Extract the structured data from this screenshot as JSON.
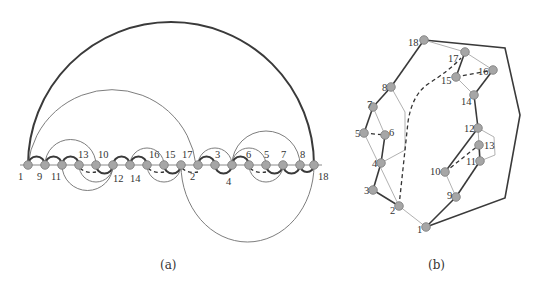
{
  "colors": {
    "node_fill": "#a6a6a6",
    "node_stroke": "#7a7a7a",
    "thick_edge": "#3a3a3a",
    "thin_edge": "#6e6e6e",
    "light_edge": "#a8a8a8",
    "dashed_edge": "#333333",
    "label": "#333333"
  },
  "panel_a": {
    "caption": "(a)",
    "spine_order": [
      "1",
      "9",
      "11",
      "13",
      "10",
      "12",
      "14",
      "16",
      "15",
      "17",
      "2",
      "3",
      "4",
      "6",
      "5",
      "7",
      "8",
      "18"
    ],
    "spine_x": [
      28,
      45,
      62,
      79,
      96,
      113,
      130,
      147,
      164,
      181,
      198,
      215,
      232,
      249,
      266,
      283,
      300,
      314
    ],
    "spine_y": 165,
    "labels_above": [
      "13",
      "10",
      "16",
      "15",
      "17",
      "3",
      "6",
      "5",
      "7",
      "8"
    ],
    "labels_below": [
      "1",
      "9",
      "11",
      "12",
      "14",
      "2",
      "4",
      "18"
    ],
    "node_labels": {
      "1": "1",
      "9": "9",
      "11": "11",
      "13": "13",
      "10": "10",
      "12": "12",
      "14": "14",
      "16": "16",
      "15": "15",
      "17": "17",
      "2": "2",
      "3": "3",
      "4": "4",
      "6": "6",
      "5": "5",
      "7": "7",
      "8": "8",
      "18": "18"
    }
  },
  "panel_b": {
    "caption": "(b)",
    "nodes": [
      {
        "id": "18",
        "x": 424,
        "y": 40
      },
      {
        "id": "17",
        "x": 465,
        "y": 52
      },
      {
        "id": "16",
        "x": 493,
        "y": 70
      },
      {
        "id": "15",
        "x": 456,
        "y": 77
      },
      {
        "id": "8",
        "x": 391,
        "y": 87
      },
      {
        "id": "7",
        "x": 373,
        "y": 107
      },
      {
        "id": "14",
        "x": 474,
        "y": 95
      },
      {
        "id": "5",
        "x": 364,
        "y": 133
      },
      {
        "id": "6",
        "x": 385,
        "y": 135
      },
      {
        "id": "12",
        "x": 478,
        "y": 128
      },
      {
        "id": "13",
        "x": 479,
        "y": 145
      },
      {
        "id": "11",
        "x": 480,
        "y": 161
      },
      {
        "id": "4",
        "x": 381,
        "y": 163
      },
      {
        "id": "10",
        "x": 445,
        "y": 172
      },
      {
        "id": "3",
        "x": 373,
        "y": 190
      },
      {
        "id": "9",
        "x": 456,
        "y": 197
      },
      {
        "id": "2",
        "x": 399,
        "y": 206
      },
      {
        "id": "1",
        "x": 426,
        "y": 227
      }
    ]
  }
}
